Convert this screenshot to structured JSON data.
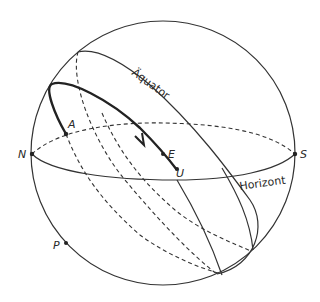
{
  "diagram": {
    "type": "celestial-sphere",
    "colors": {
      "stroke": "#333333",
      "background": "#ffffff"
    },
    "labels": {
      "equator": "Äquator",
      "horizon": "Horizont",
      "north": "N",
      "south": "S",
      "east": "E",
      "point_a": "A",
      "point_u": "U",
      "point_p": "P"
    },
    "elements": [
      "sphere-outline",
      "horizon-circle",
      "equator-circle",
      "day-arc",
      "parallel-circles"
    ]
  }
}
